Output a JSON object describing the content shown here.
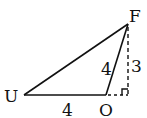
{
  "diagram": {
    "type": "geometry-triangle",
    "vertices": {
      "U": {
        "label": "U"
      },
      "O": {
        "label": "O"
      },
      "F": {
        "label": "F"
      }
    },
    "segments": [
      {
        "from": "U",
        "to": "O",
        "length_label": "4",
        "style": "solid"
      },
      {
        "from": "O",
        "to": "F",
        "length_label": "4",
        "style": "solid"
      },
      {
        "from": "U",
        "to": "F",
        "length_label": "",
        "style": "solid"
      },
      {
        "from": "O",
        "to": "foot",
        "length_label": "",
        "style": "dashed"
      },
      {
        "from": "F",
        "to": "foot",
        "length_label": "3",
        "style": "dashed"
      }
    ],
    "right_angle_at": "foot",
    "labels": {
      "U": "U",
      "O": "O",
      "F": "F",
      "UO": "4",
      "OF": "4",
      "height": "3"
    },
    "colors": {
      "stroke": "#111111",
      "background": "#ffffff"
    }
  }
}
